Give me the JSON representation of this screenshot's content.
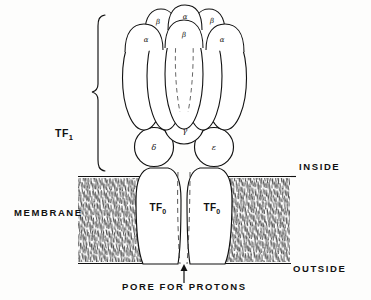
{
  "figure": {
    "background_color": "#fdfdfc",
    "stroke_color": "#111111"
  },
  "labels": {
    "tf1": "TF",
    "tf1_sub": "1",
    "tfo_left": "TF",
    "tfo_left_sub": "0",
    "tfo_right": "TF",
    "tfo_right_sub": "0",
    "membrane": "MEMBRANE",
    "inside": "INSIDE",
    "outside": "OUTSIDE",
    "pore": "PORE FOR PROTONS"
  },
  "subunits": {
    "top_row": [
      {
        "name": "beta-top-left",
        "glyph": "β",
        "x": 158,
        "y": 22
      },
      {
        "name": "alpha-top-mid",
        "glyph": "α",
        "x": 185,
        "y": 17
      },
      {
        "name": "beta-top-right",
        "glyph": "β",
        "x": 212,
        "y": 21
      }
    ],
    "second_row": [
      {
        "name": "alpha-front-left",
        "glyph": "α",
        "x": 146,
        "y": 40
      },
      {
        "name": "beta-front-mid",
        "glyph": "β",
        "x": 184,
        "y": 35
      },
      {
        "name": "alpha-front-right",
        "glyph": "α",
        "x": 222,
        "y": 40
      }
    ],
    "stalk": [
      {
        "name": "gamma",
        "glyph": "γ",
        "x": 185,
        "y": 130
      },
      {
        "name": "delta",
        "glyph": "δ",
        "x": 154,
        "y": 147
      },
      {
        "name": "epsilon",
        "glyph": "ε",
        "x": 214,
        "y": 147
      }
    ]
  },
  "membrane": {
    "top_y": 174,
    "bottom_y": 264,
    "left_edge_x": 78,
    "right_edge_x": 290
  }
}
